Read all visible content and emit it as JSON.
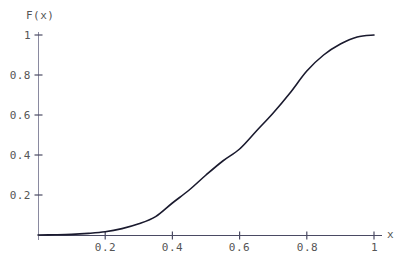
{
  "chart_data": {
    "type": "line",
    "title": "",
    "subtitle": "",
    "xlabel": "x",
    "ylabel": "F(x)",
    "xlim": [
      0,
      1
    ],
    "ylim": [
      0,
      1
    ],
    "grid": false,
    "legend": null,
    "legend_position": "none",
    "xticks": [
      "0.2",
      "0.4",
      "0.6",
      "0.8",
      "1"
    ],
    "xtick_values": [
      0.2,
      0.4,
      0.6,
      0.8,
      1
    ],
    "yticks": [
      "0.2",
      "0.4",
      "0.6",
      "0.8",
      "1"
    ],
    "ytick_values": [
      0.2,
      0.4,
      0.6,
      0.8,
      1
    ],
    "series": [
      {
        "name": "F(x)",
        "color": "#1a1a2e",
        "x": [
          0.0,
          0.05,
          0.1,
          0.15,
          0.2,
          0.25,
          0.3,
          0.35,
          0.4,
          0.45,
          0.5,
          0.55,
          0.6,
          0.65,
          0.7,
          0.75,
          0.8,
          0.85,
          0.9,
          0.95,
          1.0
        ],
        "values": [
          0.0,
          0.001,
          0.003,
          0.008,
          0.016,
          0.032,
          0.056,
          0.092,
          0.16,
          0.225,
          0.3,
          0.37,
          0.43,
          0.52,
          0.61,
          0.71,
          0.82,
          0.9,
          0.955,
          0.99,
          1.0
        ]
      }
    ]
  },
  "axes": {
    "y_label_text": "F(x)",
    "x_label_text": "x",
    "axis_color": "#4a4a63",
    "curve_color": "#1a1a2e",
    "tick_color": "#555555"
  }
}
